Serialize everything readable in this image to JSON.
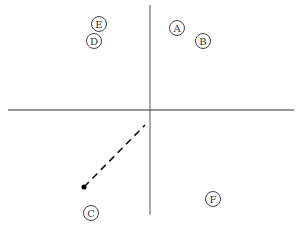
{
  "diagram": {
    "axes": {
      "horizontal": {
        "x1": 8,
        "y1": 110,
        "x2": 294,
        "y2": 110,
        "color": "#333333"
      },
      "vertical": {
        "x1": 150,
        "y1": 5,
        "x2": 150,
        "y2": 215,
        "color": "#555555"
      }
    },
    "points": [
      {
        "label": "E",
        "cx": 99,
        "cy": 24
      },
      {
        "label": "D",
        "cx": 94,
        "cy": 41
      },
      {
        "label": "A",
        "cx": 177,
        "cy": 28
      },
      {
        "label": "B",
        "cx": 203,
        "cy": 41
      },
      {
        "label": "C",
        "cx": 91,
        "cy": 213
      },
      {
        "label": "F",
        "cx": 213,
        "cy": 199
      }
    ],
    "dashed_line": {
      "x1": 84,
      "y1": 187,
      "x2": 145,
      "y2": 125,
      "color": "#111111"
    },
    "dot": {
      "cx": 84,
      "cy": 187,
      "r": 2.5,
      "color": "#000000"
    }
  }
}
